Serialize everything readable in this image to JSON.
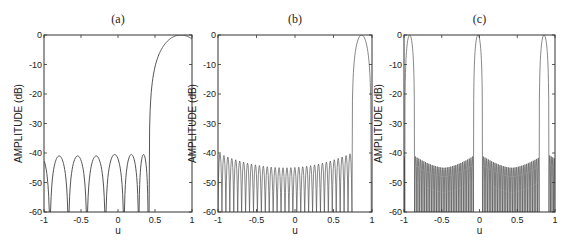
{
  "chart_data": [
    {
      "type": "line",
      "title": "(a)",
      "xlabel": "u",
      "ylabel": "AMPLITUDE (dB)",
      "xlim": [
        -1,
        1
      ],
      "ylim": [
        -60,
        0
      ],
      "xticks": [
        "-1",
        "-0.5",
        "0",
        "0.5",
        "1"
      ],
      "yticks": [
        "0",
        "-10",
        "-20",
        "-30",
        "-40",
        "-50",
        "-60"
      ],
      "grid": false,
      "box": [
        44,
        35,
        192,
        212
      ],
      "main_lobes": [
        {
          "center": 0.85,
          "left_null": 0.42,
          "right_null": 1.28
        }
      ],
      "sidelobe_nulls": [
        -0.92,
        -0.67,
        -0.42,
        -0.17,
        0.08,
        0.28,
        0.41
      ],
      "sidelobe_peaks_db": [
        -41,
        -41,
        -41,
        -40.5,
        -40.5,
        -40.5,
        -40.5
      ],
      "sidelobe_level_db": -40
    },
    {
      "type": "line",
      "title": "(b)",
      "xlabel": "u",
      "ylabel": "AMPLITUDE (dB)",
      "xlim": [
        -1,
        1
      ],
      "ylim": [
        -60,
        0
      ],
      "xticks": [
        "-1",
        "-0.5",
        "0",
        "0.5",
        "1"
      ],
      "yticks": [
        "0",
        "-10",
        "-20",
        "-30",
        "-40",
        "-50",
        "-60"
      ],
      "grid": false,
      "box": [
        218,
        35,
        372,
        212
      ],
      "main_lobes": [
        {
          "center": 0.865,
          "left_null": 0.74,
          "right_null": 0.99
        }
      ],
      "sidelobe_region": [
        -1,
        0.74
      ],
      "sidelobe_count": 34,
      "sidelobe_envelope_db": {
        "edges": -40,
        "center": -45
      },
      "sidelobe_level_db": -40
    },
    {
      "type": "line",
      "title": "(c)",
      "xlabel": "u",
      "ylabel": "AMPLITUDE (dB)",
      "xlim": [
        -1,
        1
      ],
      "ylim": [
        -60,
        0
      ],
      "xticks": [
        "-1",
        "-0.5",
        "0",
        "0.5",
        "1"
      ],
      "yticks": [
        "0",
        "-10",
        "-20",
        "-30",
        "-40",
        "-50",
        "-60"
      ],
      "grid": false,
      "box": [
        404,
        35,
        555,
        212
      ],
      "main_lobes": [
        {
          "center": -0.92,
          "left_null": -0.99,
          "right_null": -0.86
        },
        {
          "center": -0.02,
          "left_null": -0.08,
          "right_null": 0.04
        },
        {
          "center": 0.86,
          "left_null": 0.79,
          "right_null": 0.92
        }
      ],
      "sidelobe_regions": [
        [
          -1,
          -0.99
        ],
        [
          -0.86,
          -0.08
        ],
        [
          0.04,
          0.79
        ],
        [
          0.92,
          1
        ]
      ],
      "sidelobe_envelope_db": {
        "edges": -40,
        "center": -45
      },
      "sidelobe_level_db": -40,
      "sidelobe_density_per_unit": 45
    }
  ],
  "colors": {
    "line": "#555555",
    "axis": "#333333",
    "text": "#222222"
  }
}
